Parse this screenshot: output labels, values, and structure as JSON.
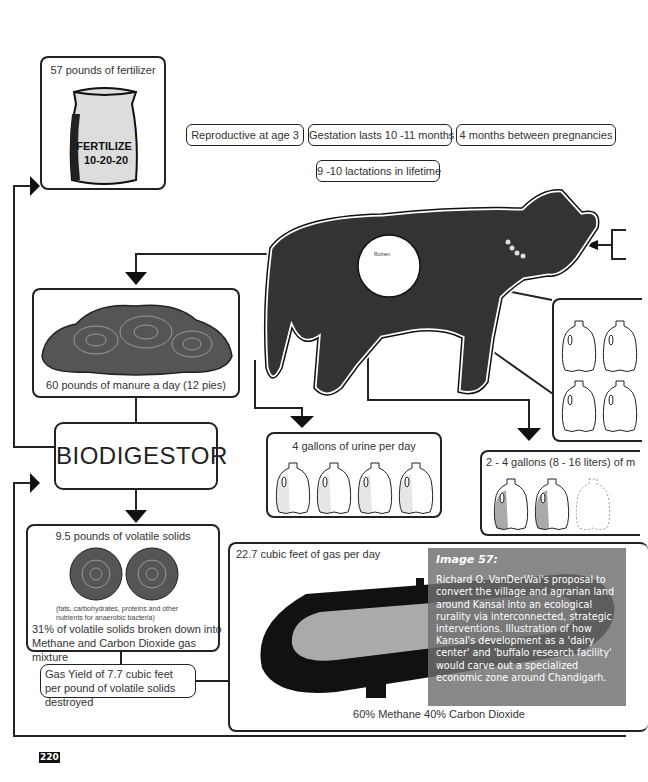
{
  "fertilizer": {
    "label": "57 pounds of fertilizer",
    "bag_text_line1": "FERTILIZE",
    "bag_text_line2": "10-20-20"
  },
  "cow_facts": [
    "Reproductive at age 3",
    "Gestation lasts 10 -11 months",
    "4 months between pregnancies",
    "9 -10 lactations in lifetime"
  ],
  "cow": {
    "organ_label": "Rumen"
  },
  "manure": {
    "label": "60 pounds of manure a day (12 pies)"
  },
  "biodigestor": {
    "label": "BIODIGESTOR"
  },
  "urine": {
    "label": "4 gallons of urine per day",
    "jug_count": 4
  },
  "milk": {
    "label": "2 - 4 gallons (8 - 16 liters) of m",
    "filled_jugs": 2,
    "empty_jugs": 1
  },
  "volatile_solids": {
    "label": "9.5 pounds of volatile solids",
    "note": "(fats, carbohydrates, proteins and other nutrients for anaerobic bacteria)",
    "breakdown": "31%  of volatile solids broken down into Methane and Carbon Dioxide gas mixture"
  },
  "gas_yield": {
    "label": "Gas Yield of 7.7 cubic feet per pound of volatile solids destroyed"
  },
  "gas_tank": {
    "label": "22.7 cubic feet of gas per day",
    "composition": "60% Methane 40% Carbon Dioxide"
  },
  "caption": {
    "title": "Image 57:",
    "body": "Richard O. VanDerWal's proposal to convert the village and agrarian land around Kansal into an ecological rurality via interconnected, strategic interventions. Illustration of how Kansal's development as a 'dairy center' and 'buffalo research facility' would carve out a specialized economic zone around Chandigarh."
  },
  "page_number": "220"
}
